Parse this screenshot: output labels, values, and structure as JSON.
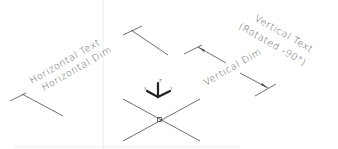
{
  "drawing": {
    "background": "#ffffff",
    "line_color": "#4a4a4a",
    "text_color": "#5a5a5a",
    "labels": {
      "horizontal_text": "Horizontal Text",
      "horizontal_dim": "Horizontal Dim",
      "vertical_dim": "Vertical Dim",
      "vertical_text_line1": "Vertical Text",
      "vertical_text_line2": "(Rotated -90°)"
    },
    "ucs_icon": {
      "axis_x": "X",
      "axis_y": "Y",
      "axis_z": "Z"
    },
    "origin_marker": "point-marker"
  }
}
